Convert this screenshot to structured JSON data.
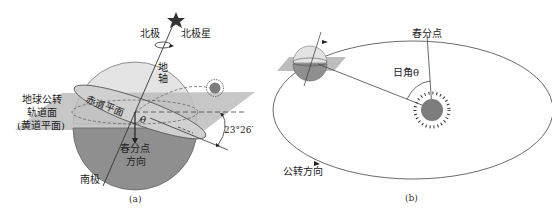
{
  "panel_a": {
    "caption": "(a)",
    "labels": {
      "north_pole": "北极",
      "polaris": "北极星",
      "earth_axis": "地轴",
      "equatorial_plane": "赤道平面",
      "orbital_plane_line1": "地球公转",
      "orbital_plane_line2": "轨道面",
      "orbital_plane_line3": "(黄道平面)",
      "theta": "θ",
      "vernal_direction_line1": "春分点",
      "vernal_direction_line2": "方向",
      "south_pole": "南极",
      "tilt_angle": "23°26′"
    }
  },
  "panel_b": {
    "caption": "(b)",
    "labels": {
      "vernal_equinox": "春分点",
      "solar_angle": "日角θ",
      "revolution_direction": "公转方向"
    }
  },
  "colors": {
    "sphere_top": "#e2e2e2",
    "sphere_bottom": "#8c8c8c",
    "plane": "#b9b9b9",
    "equator_band": "#cfcfcf",
    "sun": "#7d7d7d",
    "line": "#333333"
  }
}
